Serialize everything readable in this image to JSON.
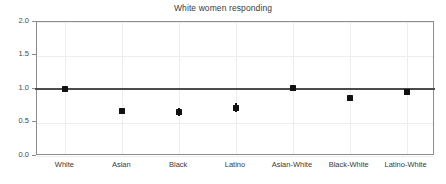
{
  "chart_data": {
    "type": "scatter",
    "title": "White women responding",
    "xlabel": "",
    "ylabel": "",
    "ylim": [
      0.0,
      2.0
    ],
    "yticks": [
      "0.0",
      "0.5",
      "1.0",
      "1.5",
      "2.0"
    ],
    "ytick_values": [
      0.0,
      0.5,
      1.0,
      1.5,
      2.0
    ],
    "grid": true,
    "legend": "none",
    "reference_line": 1.0,
    "categories": [
      "White",
      "Asian",
      "Black",
      "Latino",
      "Asian-White",
      "Black-White",
      "Latino-White"
    ],
    "values": [
      1.0,
      0.67,
      0.65,
      0.71,
      1.02,
      0.86,
      0.96
    ],
    "error_low": [
      1.0,
      0.67,
      0.59,
      0.66,
      0.99,
      0.82,
      0.96
    ],
    "error_high": [
      1.0,
      0.67,
      0.72,
      0.79,
      1.05,
      0.9,
      0.96
    ],
    "points": [
      {
        "label": "White",
        "value": 1.0,
        "low": 1.0,
        "high": 1.0
      },
      {
        "label": "Asian",
        "value": 0.67,
        "low": 0.67,
        "high": 0.67
      },
      {
        "label": "Black",
        "value": 0.65,
        "low": 0.59,
        "high": 0.72
      },
      {
        "label": "Latino",
        "value": 0.71,
        "low": 0.66,
        "high": 0.79
      },
      {
        "label": "Asian-White",
        "value": 1.02,
        "low": 0.99,
        "high": 1.05
      },
      {
        "label": "Black-White",
        "value": 0.86,
        "low": 0.82,
        "high": 0.9
      },
      {
        "label": "Latino-White",
        "value": 0.96,
        "low": 0.96,
        "high": 0.96
      }
    ],
    "colors": {
      "marker": "#111111",
      "reference_line": "#4b4b4b",
      "axis": "#8c8c8c",
      "grid": "#ededed",
      "text": "#3a3a3a",
      "background": "#ffffff"
    }
  }
}
